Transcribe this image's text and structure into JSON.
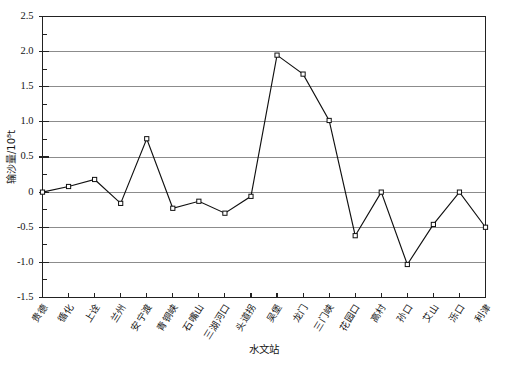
{
  "chart_data": {
    "type": "line",
    "title": "",
    "xlabel": "水文站",
    "ylabel": "输沙量/10⁸t",
    "categories": [
      "贵德",
      "循化",
      "上诠",
      "兰州",
      "安宁渡",
      "青铜峡",
      "石嘴山",
      "三湖河口",
      "头道拐",
      "吴堡",
      "龙门",
      "三门峡",
      "花园口",
      "高村",
      "孙口",
      "艾山",
      "泺口",
      "利津"
    ],
    "x": [
      "贵德",
      "循化",
      "上诠",
      "兰州",
      "安宁渡",
      "青铜峡",
      "石嘴山",
      "三湖河口",
      "头道拐",
      "吴堡",
      "龙门",
      "三门峡",
      "花园口",
      "高村",
      "孙口",
      "艾山",
      "泺口",
      "利津"
    ],
    "values": [
      0.0,
      0.08,
      0.18,
      -0.16,
      0.76,
      -0.23,
      -0.13,
      -0.3,
      -0.06,
      1.95,
      1.68,
      1.02,
      -0.62,
      0.0,
      -1.03,
      -0.46,
      0.0,
      -0.5
    ],
    "series": [
      {
        "name": "输沙量",
        "values": [
          0.0,
          0.08,
          0.18,
          -0.16,
          0.76,
          -0.23,
          -0.13,
          -0.3,
          -0.06,
          1.95,
          1.68,
          1.02,
          -0.62,
          0.0,
          -1.03,
          -0.46,
          0.0,
          -0.5
        ]
      }
    ],
    "ylim": [
      -1.5,
      2.5
    ],
    "yticks": [
      2.5,
      2.0,
      1.5,
      1.0,
      0.5,
      0,
      -0.5,
      -1.0,
      -1.5
    ],
    "ytick_labels": [
      "2.5",
      "2.0",
      "1.5",
      "1.0",
      "0.5",
      "0",
      "-0.5",
      "-1.0",
      "-1.5"
    ],
    "y_minor_step": 0.25,
    "grid": "horizontal",
    "legend": "none",
    "marker": "open-square",
    "line_color": "#101010",
    "grid_color": "#8c8c8c",
    "axis_color": "#222222"
  }
}
